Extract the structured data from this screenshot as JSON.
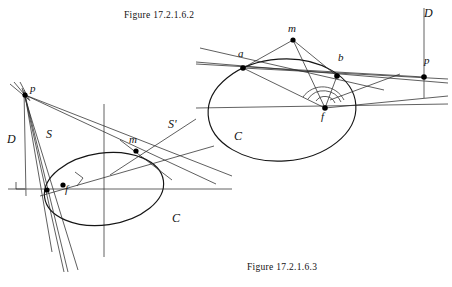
{
  "page": {
    "width": 452,
    "height": 287,
    "background": "#ffffff",
    "ink_color": "#151515"
  },
  "captions": {
    "top": "Figure 17.2.1.6.2",
    "bottom": "Figure 17.2.1.6.3"
  },
  "figures": [
    {
      "id": "figure-left",
      "caption": "Figure 17.2.1.6.2",
      "description": "Conic C with focus f, directrix D, point p on directrix, tangent point m, segments S and S'",
      "labels": [
        {
          "name": "p",
          "text": "p",
          "x": 30,
          "y": 88
        },
        {
          "name": "D",
          "text": "D",
          "x": 7,
          "y": 139
        },
        {
          "name": "S",
          "text": "S",
          "x": 46,
          "y": 134
        },
        {
          "name": "S-prime",
          "text": "S'",
          "x": 168,
          "y": 124
        },
        {
          "name": "m",
          "text": "m",
          "x": 130,
          "y": 140
        },
        {
          "name": "f",
          "text": "f",
          "x": 65,
          "y": 190
        },
        {
          "name": "C",
          "text": "C",
          "x": 172,
          "y": 218
        }
      ],
      "points": [
        {
          "name": "p",
          "x": 25,
          "y": 95
        },
        {
          "name": "m",
          "x": 136,
          "y": 151
        },
        {
          "name": "f",
          "x": 63,
          "y": 185
        },
        {
          "name": "conic-point",
          "x": 47,
          "y": 190
        }
      ],
      "conic": {
        "type": "ellipse",
        "cx": 104,
        "cy": 189,
        "rx": 60,
        "ry": 36,
        "rotation": -8
      }
    },
    {
      "id": "figure-right",
      "caption": "Figure 17.2.1.6.3",
      "description": "Conic C with focus f, chord a-b, external point m, directrix D with pole p, equal angles marked at f",
      "labels": [
        {
          "name": "m",
          "text": "m",
          "x": 288,
          "y": 28
        },
        {
          "name": "a",
          "text": "a",
          "x": 238,
          "y": 53
        },
        {
          "name": "b",
          "text": "b",
          "x": 338,
          "y": 57
        },
        {
          "name": "D",
          "text": "D",
          "x": 424,
          "y": 12
        },
        {
          "name": "p",
          "text": "p",
          "x": 424,
          "y": 60
        },
        {
          "name": "f",
          "text": "f",
          "x": 321,
          "y": 116
        },
        {
          "name": "C",
          "text": "C",
          "x": 234,
          "y": 136
        }
      ],
      "points": [
        {
          "name": "m",
          "x": 293,
          "y": 40
        },
        {
          "name": "a",
          "x": 243,
          "y": 68
        },
        {
          "name": "b",
          "x": 337,
          "y": 76
        },
        {
          "name": "f",
          "x": 325,
          "y": 108
        },
        {
          "name": "p",
          "x": 424,
          "y": 77
        }
      ],
      "conic": {
        "type": "ellipse",
        "cx": 282,
        "cy": 110,
        "rx": 74,
        "ry": 51,
        "rotation": -4
      },
      "angle_marks": {
        "at": "f",
        "count": 2,
        "style": "double-arc"
      }
    }
  ]
}
